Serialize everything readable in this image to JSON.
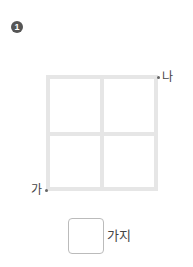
{
  "problem": {
    "number": "1",
    "badge_color": "#555555"
  },
  "figure": {
    "type": "2x2-grid-paths",
    "line_color": "#e6e6e6",
    "start_point": {
      "label": "가",
      "position": "bottom-left"
    },
    "end_point": {
      "label": "나",
      "position": "top-right"
    }
  },
  "answer": {
    "value": "",
    "unit": "가지"
  }
}
